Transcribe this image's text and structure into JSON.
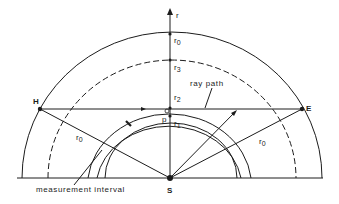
{
  "figure": {
    "axis_label": "r",
    "radius_labels": {
      "r0_top": "r",
      "r0_top_sub": "0",
      "r3": "r",
      "r3_sub": "3",
      "r2": "r",
      "r2_sub": "2",
      "r1": "r",
      "r1_sub": "1",
      "r0_left": "r",
      "r0_left_sub": "0",
      "r0_right": "r",
      "r0_right_sub": "0"
    },
    "points": {
      "H": "H",
      "E": "E",
      "S": "S",
      "P": "p"
    },
    "annotations": {
      "ray_path": "ray path",
      "measurement_interval": "measurement interval"
    },
    "colors": {
      "line": "#1c1c1c",
      "background": "#ffffff"
    }
  }
}
